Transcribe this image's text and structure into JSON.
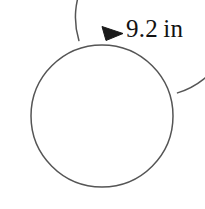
{
  "figure": {
    "background_color": "#ffffff",
    "stroke_color": "#555555",
    "arrow_color": "#1a1a1a",
    "label_color": "#121212",
    "measurement": {
      "value": "9.2",
      "unit": "in",
      "full_text": "9.2 in"
    },
    "circle": {
      "center_x": 102,
      "center_y": 116,
      "radius": 71,
      "stroke_width": 1.5
    },
    "arrow_arc": {
      "radius": 79,
      "stroke_width": 1.5,
      "direction": "clockwise",
      "arrowhead": "filled-triangle"
    }
  },
  "chart_data": {
    "type": "diagram",
    "shape": "circle",
    "annotations": [
      {
        "name": "circumference",
        "label": "9.2 in",
        "value": 9.2,
        "unit": "in",
        "marker": "curved-arrow"
      }
    ]
  }
}
